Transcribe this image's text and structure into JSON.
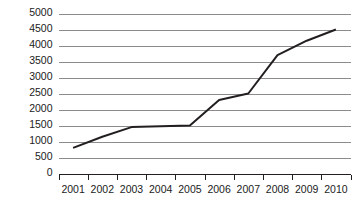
{
  "chart_data": {
    "type": "line",
    "title": "",
    "subtitle": "",
    "xlabel": "",
    "ylabel": "",
    "categories": [
      "2001",
      "2002",
      "2003",
      "2004",
      "2005",
      "2006",
      "2007",
      "2008",
      "2009",
      "2010"
    ],
    "values": [
      800,
      1150,
      1450,
      1480,
      1500,
      2300,
      2500,
      3700,
      4150,
      4500
    ],
    "series": [
      {
        "name": "",
        "values": [
          800,
          1150,
          1450,
          1480,
          1500,
          2300,
          2500,
          3700,
          4150,
          4500
        ]
      }
    ],
    "ylim": [
      0,
      5000
    ],
    "ytick_labels": [
      "0",
      "500",
      "1000",
      "1500",
      "2000",
      "2500",
      "3000",
      "3500",
      "4000",
      "4500",
      "5000"
    ],
    "ytick_values": [
      0,
      500,
      1000,
      1500,
      2000,
      2500,
      3000,
      3500,
      4000,
      4500,
      5000
    ],
    "ytick_step": 500,
    "xtick_labels": [
      "2001",
      "2002",
      "2003",
      "2004",
      "2005",
      "2006",
      "2007",
      "2008",
      "2009",
      "2010"
    ],
    "grid": true,
    "grid_axis": "y",
    "legend": false,
    "legend_position": "none",
    "annotations": [],
    "colors": {
      "background": "#ffffff",
      "series_line": "#231f20",
      "gridline": "#8c8c8c",
      "axis": "#231f20",
      "tick_text": "#1c1c1c"
    },
    "line_width": 2,
    "markers": false
  },
  "axes": {
    "y_axis_name": "value-axis",
    "x_axis_name": "year-axis"
  }
}
